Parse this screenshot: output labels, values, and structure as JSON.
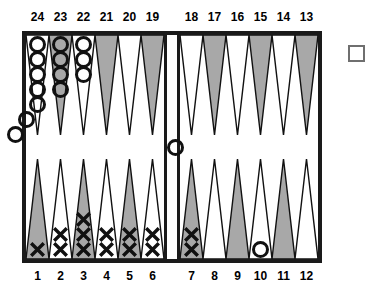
{
  "board": {
    "game": "Backgammon",
    "top_numbers_left": [
      "24",
      "23",
      "22",
      "21",
      "20",
      "19"
    ],
    "top_numbers_right": [
      "18",
      "17",
      "16",
      "15",
      "14",
      "13"
    ],
    "bottom_numbers_left": [
      "1",
      "2",
      "3",
      "4",
      "5",
      "6"
    ],
    "bottom_numbers_right": [
      "7",
      "8",
      "9",
      "10",
      "11",
      "12"
    ],
    "colors": {
      "frame": "#1a1a1a",
      "point_dark": "#a8a8a8",
      "point_light": "#ffffff",
      "point_outline": "#111111",
      "checker_o_outline": "#111111",
      "checker_x_stroke": "#111111",
      "cube_outline": "#6f6f6f",
      "background": "#ffffff",
      "text": "#000000"
    },
    "points": [
      {
        "number": "24",
        "quadrant": "top-left",
        "index": 0,
        "shade": "light",
        "checkers": 7,
        "checker_type": "O"
      },
      {
        "number": "23",
        "quadrant": "top-left",
        "index": 1,
        "shade": "dark",
        "checkers": 4,
        "checker_type": "O"
      },
      {
        "number": "22",
        "quadrant": "top-left",
        "index": 2,
        "shade": "light",
        "checkers": 3,
        "checker_type": "O"
      },
      {
        "number": "21",
        "quadrant": "top-left",
        "index": 3,
        "shade": "dark",
        "checkers": 0,
        "checker_type": null
      },
      {
        "number": "20",
        "quadrant": "top-left",
        "index": 4,
        "shade": "light",
        "checkers": 0,
        "checker_type": null
      },
      {
        "number": "19",
        "quadrant": "top-left",
        "index": 5,
        "shade": "dark",
        "checkers": 0,
        "checker_type": null
      },
      {
        "number": "18",
        "quadrant": "top-right",
        "index": 0,
        "shade": "light",
        "checkers": 0,
        "checker_type": null
      },
      {
        "number": "17",
        "quadrant": "top-right",
        "index": 1,
        "shade": "dark",
        "checkers": 0,
        "checker_type": null
      },
      {
        "number": "16",
        "quadrant": "top-right",
        "index": 2,
        "shade": "light",
        "checkers": 0,
        "checker_type": null
      },
      {
        "number": "15",
        "quadrant": "top-right",
        "index": 3,
        "shade": "dark",
        "checkers": 0,
        "checker_type": null
      },
      {
        "number": "14",
        "quadrant": "top-right",
        "index": 4,
        "shade": "light",
        "checkers": 0,
        "checker_type": null
      },
      {
        "number": "13",
        "quadrant": "top-right",
        "index": 5,
        "shade": "dark",
        "checkers": 0,
        "checker_type": null
      },
      {
        "number": "1",
        "quadrant": "bottom-left",
        "index": 0,
        "shade": "dark",
        "checkers": 1,
        "checker_type": "X"
      },
      {
        "number": "2",
        "quadrant": "bottom-left",
        "index": 1,
        "shade": "light",
        "checkers": 2,
        "checker_type": "X"
      },
      {
        "number": "3",
        "quadrant": "bottom-left",
        "index": 2,
        "shade": "dark",
        "checkers": 3,
        "checker_type": "X"
      },
      {
        "number": "4",
        "quadrant": "bottom-left",
        "index": 3,
        "shade": "light",
        "checkers": 2,
        "checker_type": "X"
      },
      {
        "number": "5",
        "quadrant": "bottom-left",
        "index": 4,
        "shade": "dark",
        "checkers": 2,
        "checker_type": "X"
      },
      {
        "number": "6",
        "quadrant": "bottom-left",
        "index": 5,
        "shade": "light",
        "checkers": 2,
        "checker_type": "X"
      },
      {
        "number": "7",
        "quadrant": "bottom-right",
        "index": 0,
        "shade": "dark",
        "checkers": 2,
        "checker_type": "X"
      },
      {
        "number": "8",
        "quadrant": "bottom-right",
        "index": 1,
        "shade": "light",
        "checkers": 0,
        "checker_type": null
      },
      {
        "number": "9",
        "quadrant": "bottom-right",
        "index": 2,
        "shade": "dark",
        "checkers": 0,
        "checker_type": null
      },
      {
        "number": "10",
        "quadrant": "bottom-right",
        "index": 3,
        "shade": "light",
        "checkers": 1,
        "checker_type": "O"
      },
      {
        "number": "11",
        "quadrant": "bottom-right",
        "index": 4,
        "shade": "dark",
        "checkers": 0,
        "checker_type": null
      },
      {
        "number": "12",
        "quadrant": "bottom-right",
        "index": 5,
        "shade": "light",
        "checkers": 0,
        "checker_type": null
      }
    ],
    "bar": {
      "label": "bar",
      "checkers": 1,
      "checker_type": "O"
    },
    "doubling_cube": {
      "label": "",
      "value": "",
      "position": "right-outside"
    }
  }
}
